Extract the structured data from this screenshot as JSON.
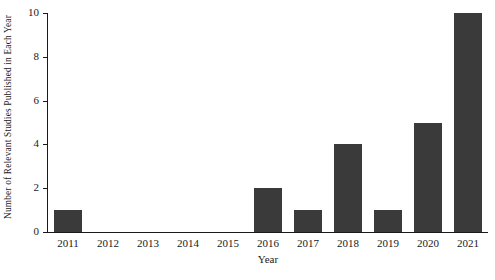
{
  "chart_data": {
    "type": "bar",
    "title": "",
    "xlabel": "Year",
    "ylabel": "Number of Relevant Studies Published in Each Year",
    "categories": [
      "2011",
      "2012",
      "2013",
      "2014",
      "2015",
      "2016",
      "2017",
      "2018",
      "2019",
      "2020",
      "2021"
    ],
    "values": [
      1,
      0,
      0,
      0,
      0,
      2,
      1,
      4,
      1,
      5,
      10
    ],
    "ylim": [
      0,
      10
    ],
    "yticks": [
      0,
      2,
      4,
      6,
      8,
      10
    ],
    "ytick_labels": [
      "0",
      "2",
      "4",
      "6",
      "8",
      "10"
    ],
    "grid": false,
    "legend": null,
    "bar_color": "#3a3a3a",
    "axis_color": "#1a1a1a",
    "background_color": "#ffffff"
  }
}
